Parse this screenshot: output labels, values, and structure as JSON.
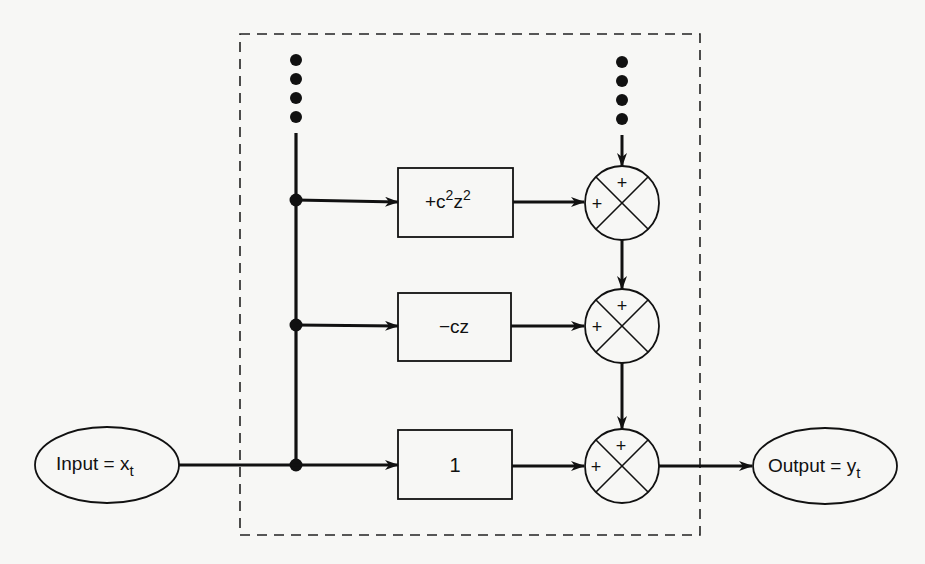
{
  "diagram": {
    "type": "block-diagram",
    "colors": {
      "background": "#f7f7f5",
      "ink": "#111111"
    },
    "input": {
      "label": "Input = x",
      "subscript": "t"
    },
    "output": {
      "label": "Output = y",
      "subscript": "t"
    },
    "blocks": [
      {
        "id": "block-top",
        "prefix": "+c",
        "sup1": "2",
        "mid": "z",
        "sup2": "2",
        "text": "+c²z²"
      },
      {
        "id": "block-middle",
        "text": "−cz"
      },
      {
        "id": "block-bottom",
        "text": "1"
      }
    ],
    "summers": [
      {
        "id": "summer-top",
        "top_sign": "+",
        "left_sign": "+"
      },
      {
        "id": "summer-middle",
        "top_sign": "+",
        "left_sign": "+"
      },
      {
        "id": "summer-bottom",
        "top_sign": "+",
        "left_sign": "+"
      }
    ],
    "continuation_marks": {
      "left": "•••• (continues upward)",
      "right": "•••• (continues upward)"
    },
    "edges": [
      "input -> junction-bottom",
      "junction-bottom -> block-bottom",
      "junction-middle -> block-middle",
      "junction-top -> block-top",
      "block-top -> summer-top",
      "block-middle -> summer-middle",
      "block-bottom -> summer-bottom",
      "summer-top -> summer-middle",
      "summer-middle -> summer-bottom",
      "summer-bottom -> output"
    ]
  }
}
